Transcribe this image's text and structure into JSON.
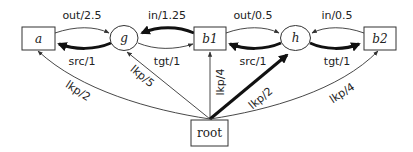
{
  "diagram": {
    "nodes": {
      "a": {
        "label": "a",
        "shape": "box"
      },
      "g": {
        "label": "g",
        "shape": "ellipse"
      },
      "b1": {
        "label": "b1",
        "shape": "box"
      },
      "h": {
        "label": "h",
        "shape": "ellipse"
      },
      "b2": {
        "label": "b2",
        "shape": "box"
      },
      "root": {
        "label": "root",
        "shape": "box"
      }
    },
    "edges": {
      "a_g": {
        "label": "out/2.5",
        "from": "a",
        "to": "g",
        "weight": "thin"
      },
      "g_a": {
        "label": "src/1",
        "from": "g",
        "to": "a",
        "weight": "thick"
      },
      "b1_g": {
        "label": "in/1.25",
        "from": "b1",
        "to": "g",
        "weight": "thick"
      },
      "g_b1": {
        "label": "tgt/1",
        "from": "g",
        "to": "b1",
        "weight": "thin"
      },
      "b1_h": {
        "label": "out/0.5",
        "from": "b1",
        "to": "h",
        "weight": "thin"
      },
      "h_b1": {
        "label": "src/1",
        "from": "h",
        "to": "b1",
        "weight": "thick"
      },
      "b2_h": {
        "label": "in/0.5",
        "from": "b2",
        "to": "h",
        "weight": "thin"
      },
      "h_b2": {
        "label": "tgt/1",
        "from": "h",
        "to": "b2",
        "weight": "thick"
      },
      "root_a": {
        "label": "lkp/2",
        "from": "root",
        "to": "a",
        "weight": "thin"
      },
      "root_g": {
        "label": "lkp/5",
        "from": "root",
        "to": "g",
        "weight": "thin"
      },
      "root_b1": {
        "label": "lkp/4",
        "from": "root",
        "to": "b1",
        "weight": "thin"
      },
      "root_h": {
        "label": "lkp/2",
        "from": "root",
        "to": "h",
        "weight": "thick"
      },
      "root_b2": {
        "label": "lkp/4",
        "from": "root",
        "to": "b2",
        "weight": "thin"
      }
    }
  }
}
